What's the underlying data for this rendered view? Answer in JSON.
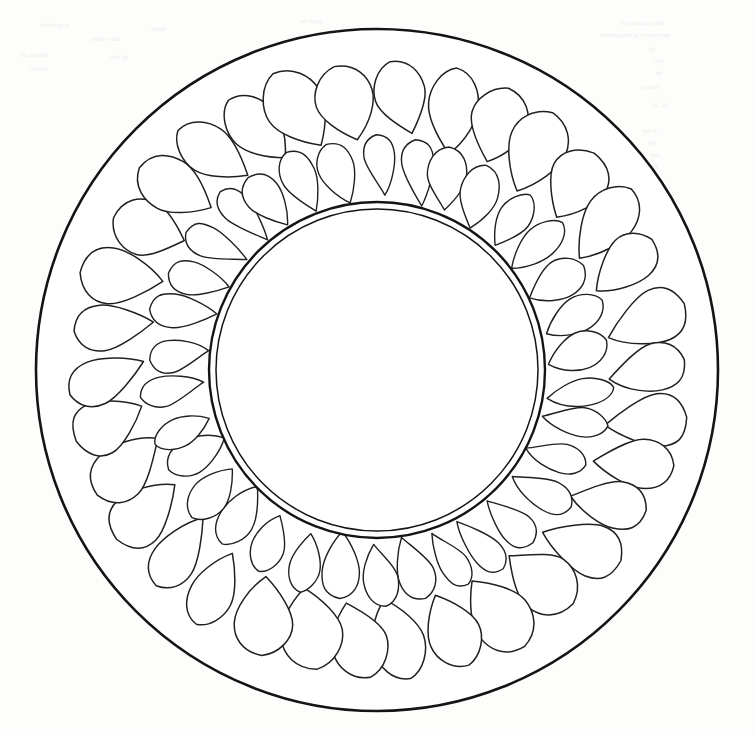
{
  "document": {
    "kind": "scanned-line-drawing",
    "caption": "",
    "page_background": "#fdfdfc",
    "ink_color": "#141414",
    "interior_fill": "#ffffff"
  },
  "figure": {
    "name": "circular-egg-arrangement",
    "center": {
      "x": 377,
      "y": 370
    },
    "outer_circle": {
      "label": "outer-rim",
      "radius": 341,
      "stroke_width": 2.6,
      "stroke": "#141414"
    },
    "inner_circle_outer": {
      "label": "inner-rim-outer",
      "radius": 168,
      "stroke_width": 2.4,
      "stroke": "#141414"
    },
    "inner_circle_inner": {
      "label": "inner-rim-inner",
      "radius": 161,
      "stroke_width": 1.5,
      "stroke": "#141414"
    },
    "rings": [
      {
        "name": "outer-egg-ring",
        "count": 34,
        "orbit_radius": 272,
        "egg_length": 84,
        "egg_width": 58,
        "tilt_degrees": -13,
        "start_angle_degrees": -85,
        "stroke_width": 1.5,
        "stroke": "#202020"
      },
      {
        "name": "inner-egg-ring",
        "count": 34,
        "orbit_radius": 204,
        "egg_length": 66,
        "egg_width": 36,
        "tilt_degrees": -7,
        "start_angle_degrees": -90,
        "stroke_width": 1.4,
        "stroke": "#202020"
      }
    ]
  },
  "showthrough": {
    "note": "faint mirrored text bleeding through from the verso of the scanned leaf",
    "lines": [
      {
        "x": 620,
        "y": 18,
        "text": "the process of"
      },
      {
        "x": 600,
        "y": 30,
        "text": "necessary arrangement"
      },
      {
        "x": 648,
        "y": 44,
        "text": "of"
      },
      {
        "x": 654,
        "y": 56,
        "text": "the"
      },
      {
        "x": 656,
        "y": 68,
        "text": "in"
      },
      {
        "x": 640,
        "y": 82,
        "text": "one of"
      },
      {
        "x": 652,
        "y": 100,
        "text": "M. 2."
      },
      {
        "x": 642,
        "y": 126,
        "text": "from"
      },
      {
        "x": 648,
        "y": 138,
        "text": "by"
      },
      {
        "x": 650,
        "y": 150,
        "text": "the"
      },
      {
        "x": 646,
        "y": 162,
        "text": "Fig."
      },
      {
        "x": 651,
        "y": 176,
        "text": "a"
      },
      {
        "x": 648,
        "y": 192,
        "text": "of"
      },
      {
        "x": 649,
        "y": 206,
        "text": "to"
      },
      {
        "x": 646,
        "y": 222,
        "text": "the"
      },
      {
        "x": 648,
        "y": 238,
        "text": "and"
      },
      {
        "x": 644,
        "y": 256,
        "text": "nest"
      },
      {
        "x": 646,
        "y": 272,
        "text": "eggs"
      },
      {
        "x": 40,
        "y": 20,
        "text": "a gradual"
      },
      {
        "x": 90,
        "y": 34,
        "text": "the whole"
      },
      {
        "x": 20,
        "y": 50,
        "text": "shown in"
      },
      {
        "x": 30,
        "y": 64,
        "text": "circle"
      },
      {
        "x": 110,
        "y": 52,
        "text": "of the"
      },
      {
        "x": 150,
        "y": 24,
        "text": "layer"
      },
      {
        "x": 300,
        "y": 16,
        "text": "eggs in"
      }
    ]
  }
}
